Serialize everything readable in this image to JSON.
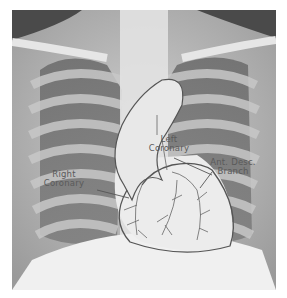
{
  "figure": {
    "labels": {
      "left_coronary": [
        "Left",
        "Coronary"
      ],
      "right_coronary": [
        "Right",
        "Coronary"
      ],
      "ant_desc_branch": [
        "Ant. Desc.",
        "Branch"
      ]
    },
    "colors": {
      "outline": "#555555",
      "label_text": "#5a5a5a",
      "bone": "#e8e8e8",
      "lung_dark": "#5a5a5a"
    }
  }
}
